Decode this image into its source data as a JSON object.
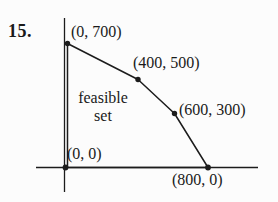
{
  "figure": {
    "problem_number": "15.",
    "region_label": {
      "line1": "feasible",
      "line2": "set"
    },
    "vertices": [
      {
        "label": "(0, 700)",
        "x": 0,
        "y": 700
      },
      {
        "label": "(400, 500)",
        "x": 400,
        "y": 500
      },
      {
        "label": "(600, 300)",
        "x": 600,
        "y": 300
      },
      {
        "label": "(800, 0)",
        "x": 800,
        "y": 0
      },
      {
        "label": "(0, 0)",
        "x": 0,
        "y": 0
      }
    ],
    "colors": {
      "background": "#fcfcfc",
      "ink": "#1c1c1c"
    }
  }
}
